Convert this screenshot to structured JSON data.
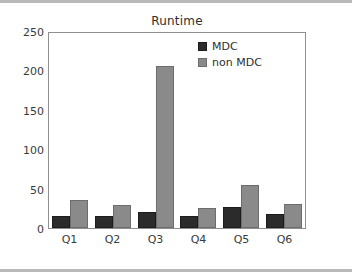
{
  "chart_data": {
    "type": "bar",
    "title": "Runtime",
    "xlabel": "",
    "ylabel": "",
    "categories": [
      "Q1",
      "Q2",
      "Q3",
      "Q4",
      "Q5",
      "Q6"
    ],
    "series": [
      {
        "name": "MDC",
        "color": "#2b2b2b",
        "values": [
          15,
          15,
          20,
          15,
          27,
          18
        ]
      },
      {
        "name": "non MDC",
        "color": "#8a8a8a",
        "values": [
          35,
          29,
          205,
          25,
          54,
          30
        ]
      }
    ],
    "ylim": [
      0,
      250
    ],
    "yticks": [
      0,
      50,
      100,
      150,
      200,
      250
    ],
    "ytick_labels": [
      "0",
      "50",
      "100",
      "150",
      "200",
      "250"
    ],
    "grid": false,
    "legend_position": "top-right"
  },
  "legend": {
    "entries": [
      {
        "label": "MDC"
      },
      {
        "label": "non MDC"
      }
    ]
  }
}
